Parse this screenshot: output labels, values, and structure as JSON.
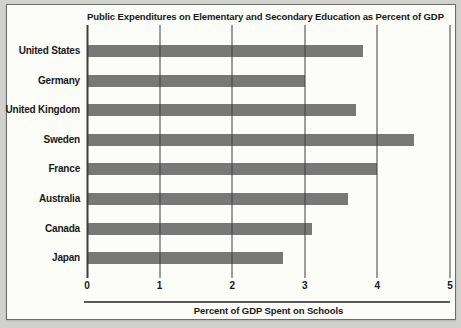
{
  "window": {
    "background_color": "#d1d2ce"
  },
  "panel": {
    "background_color": "#fcfcf9",
    "border_color": "#6b6b6b"
  },
  "chart_data": {
    "type": "bar",
    "orientation": "horizontal",
    "title": "Public Expenditures on Elementary and Secondary Education as Percent of GDP",
    "xlabel": "Percent of GDP Spent on Schools",
    "ylabel": "",
    "categories": [
      "United States",
      "Germany",
      "United Kingdom",
      "Sweden",
      "France",
      "Australia",
      "Canada",
      "Japan"
    ],
    "values": [
      3.8,
      3.0,
      3.7,
      4.5,
      4.0,
      3.6,
      3.1,
      2.7
    ],
    "xlim": [
      0,
      5
    ],
    "xticks": [
      0,
      1,
      2,
      3,
      4,
      5
    ],
    "grid": "vertical gridlines at each x tick, drawn over bars",
    "legend": "none",
    "bar_color": "#787878",
    "gridline_color": "#3e3e3e",
    "axis_rule_color": "#5a5a5a",
    "text_color": "#181818"
  }
}
